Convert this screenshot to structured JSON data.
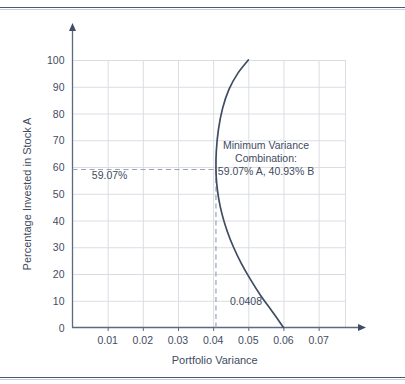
{
  "figure": {
    "background_color": "#ffffff",
    "rule_color": "#4a5a73"
  },
  "chart_data": {
    "type": "line",
    "title": "",
    "subtitle": "",
    "xlabel": "Portfolio Variance",
    "ylabel": "Percentage Invested in Stock A",
    "xlim": [
      0.0,
      0.0775
    ],
    "ylim": [
      0,
      100
    ],
    "xticks": [
      0.01,
      0.02,
      0.03,
      0.04,
      0.05,
      0.06,
      0.07
    ],
    "xtick_labels": [
      "0.01",
      "0.02",
      "0.03",
      "0.04",
      "0.05",
      "0.06",
      "0.07"
    ],
    "yticks": [
      0,
      10,
      20,
      30,
      40,
      50,
      60,
      70,
      80,
      90,
      100
    ],
    "ytick_labels": [
      "0",
      "10",
      "20",
      "30",
      "40",
      "50",
      "60",
      "70",
      "80",
      "90",
      "100"
    ],
    "grid": true,
    "grid_color": "#d9dde3",
    "legend": false,
    "legend_position": "none",
    "curve_color": "#3f4c61",
    "series": [
      {
        "name": "Portfolio variance frontier",
        "x": [
          0.05,
          0.047,
          0.0445,
          0.0427,
          0.0415,
          0.0409,
          0.0408,
          0.041,
          0.0416,
          0.0426,
          0.044,
          0.0458,
          0.048,
          0.0506,
          0.0535,
          0.0568,
          0.06
        ],
        "y": [
          100,
          95,
          89,
          82,
          74,
          66,
          59.07,
          54,
          48,
          42,
          36,
          30,
          24,
          18,
          12,
          6,
          0
        ]
      }
    ],
    "annotations": [
      {
        "name": "minimum-variance-callout",
        "lines": [
          "Minimum Variance",
          "Combination:",
          "59.07% A, 40.93% B"
        ],
        "x": 0.0465,
        "y": 62
      },
      {
        "name": "y-guide-label",
        "text": "59.07%",
        "x": 0.0055,
        "y": 55.5
      },
      {
        "name": "x-guide-label",
        "text": "0.0408",
        "x": 0.0425,
        "y": 8.5
      }
    ],
    "guides": [
      {
        "name": "horizontal-dashed-guide",
        "orientation": "horizontal",
        "value": 59.07,
        "from": 0.0,
        "to": 0.0408,
        "style": "dashed",
        "color": "#9aa4b4"
      },
      {
        "name": "vertical-dashed-guide",
        "orientation": "vertical",
        "value": 0.0408,
        "from": 0,
        "to": 59.07,
        "style": "dashed",
        "color": "#9aa4b4"
      }
    ],
    "minimum_variance_point": {
      "variance": 0.0408,
      "percent_stock_a": 59.07,
      "percent_stock_b": 40.93
    }
  }
}
